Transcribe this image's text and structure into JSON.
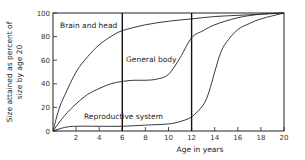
{
  "chart_data": {
    "type": "line",
    "title": "",
    "xlabel": "Age in years",
    "ylabel": "Size attained as percent of size by age 20",
    "ylabel_lines": [
      "Size attained as percent of",
      "size by age 20"
    ],
    "xlim": [
      0,
      20
    ],
    "ylim": [
      0,
      100
    ],
    "x_ticks": [
      2,
      4,
      6,
      8,
      10,
      12,
      14,
      16,
      18,
      20
    ],
    "y_ticks": [
      0,
      20,
      40,
      60,
      80,
      100
    ],
    "grid": false,
    "legend": "none (curves labeled directly)",
    "vertical_markers": [
      6,
      12
    ],
    "series": [
      {
        "name": "Brain and head",
        "x": [
          0,
          0.5,
          1,
          2,
          3,
          4,
          5,
          6,
          8,
          10,
          12,
          14,
          16,
          18,
          20
        ],
        "values": [
          0,
          18,
          30,
          50,
          63,
          73,
          80,
          85,
          90,
          93,
          95,
          97,
          98,
          99,
          100
        ]
      },
      {
        "name": "General body",
        "x": [
          0,
          1,
          2,
          3,
          4,
          5,
          6,
          7,
          8,
          9,
          10,
          11,
          12,
          13,
          14,
          16,
          18,
          20
        ],
        "values": [
          0,
          13,
          23,
          31,
          36,
          40,
          42,
          43,
          43,
          44,
          48,
          62,
          79,
          85,
          90,
          96,
          99,
          100
        ]
      },
      {
        "name": "Reproductive system",
        "x": [
          0,
          1,
          2,
          4,
          6,
          8,
          10,
          11,
          12,
          13,
          13.5,
          14,
          14.5,
          15,
          16,
          17,
          18,
          20
        ],
        "values": [
          0,
          3,
          4,
          4,
          4,
          5,
          6,
          8,
          12,
          22,
          33,
          50,
          66,
          75,
          86,
          91,
          95,
          100
        ]
      }
    ],
    "annotations": [
      "Brain and head",
      "General body",
      "Reproductive system"
    ]
  }
}
